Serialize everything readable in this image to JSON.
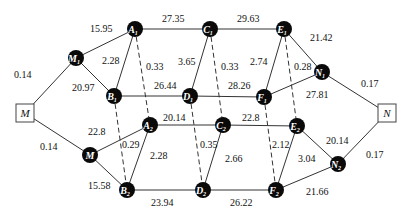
{
  "diagram": {
    "title": "",
    "terminals": [
      {
        "id": "M_src",
        "label": "M",
        "x": 25,
        "y": 113
      },
      {
        "id": "N_sink",
        "label": "N",
        "x": 387,
        "y": 113
      }
    ],
    "nodes": [
      {
        "id": "M1",
        "label": "M",
        "sub": "1",
        "x": 76,
        "y": 58
      },
      {
        "id": "A1",
        "label": "A",
        "sub": "1",
        "x": 135,
        "y": 29
      },
      {
        "id": "B1",
        "label": "B",
        "sub": "1",
        "x": 114,
        "y": 96
      },
      {
        "id": "C1",
        "label": "C",
        "sub": "1",
        "x": 210,
        "y": 29
      },
      {
        "id": "D1",
        "label": "D",
        "sub": "1",
        "x": 190,
        "y": 96
      },
      {
        "id": "E1",
        "label": "E",
        "sub": "1",
        "x": 284,
        "y": 29
      },
      {
        "id": "F1",
        "label": "F",
        "sub": "1",
        "x": 264,
        "y": 97
      },
      {
        "id": "N1",
        "label": "N",
        "sub": "1",
        "x": 322,
        "y": 72
      },
      {
        "id": "M2",
        "label": "M",
        "sub": "",
        "x": 90,
        "y": 155
      },
      {
        "id": "A2",
        "label": "A",
        "sub": "2",
        "x": 150,
        "y": 125
      },
      {
        "id": "B2",
        "label": "B",
        "sub": "2",
        "x": 127,
        "y": 190
      },
      {
        "id": "C2",
        "label": "C",
        "sub": "2",
        "x": 223,
        "y": 125
      },
      {
        "id": "D2",
        "label": "D",
        "sub": "2",
        "x": 203,
        "y": 190
      },
      {
        "id": "E2",
        "label": "E",
        "sub": "2",
        "x": 297,
        "y": 126
      },
      {
        "id": "F2",
        "label": "F",
        "sub": "2",
        "x": 276,
        "y": 190
      },
      {
        "id": "N2",
        "label": "N",
        "sub": "2",
        "x": 338,
        "y": 164
      }
    ],
    "edges": [
      {
        "from": "M_src",
        "to": "M1",
        "weight": "0.14",
        "lx": 14,
        "ly": 78,
        "dashed": false
      },
      {
        "from": "M1",
        "to": "A1",
        "weight": "15.95",
        "lx": 90,
        "ly": 32,
        "dashed": false
      },
      {
        "from": "M1",
        "to": "B1",
        "weight": "20.97",
        "lx": 72,
        "ly": 91,
        "dashed": false
      },
      {
        "from": "A1",
        "to": "B1",
        "weight": "2.28",
        "lx": 102,
        "ly": 64,
        "dashed": false
      },
      {
        "from": "A1",
        "to": "C1",
        "weight": "27.35",
        "lx": 162,
        "ly": 22,
        "dashed": false
      },
      {
        "from": "B1",
        "to": "D1",
        "weight": "26.44",
        "lx": 154,
        "ly": 89,
        "dashed": false
      },
      {
        "from": "C1",
        "to": "D1",
        "weight": "3.65",
        "lx": 178,
        "ly": 65,
        "dashed": false
      },
      {
        "from": "C1",
        "to": "E1",
        "weight": "29.63",
        "lx": 237,
        "ly": 22,
        "dashed": false
      },
      {
        "from": "D1",
        "to": "F1",
        "weight": "28.26",
        "lx": 228,
        "ly": 89,
        "dashed": false
      },
      {
        "from": "E1",
        "to": "F1",
        "weight": "2.74",
        "lx": 250,
        "ly": 65,
        "dashed": false
      },
      {
        "from": "E1",
        "to": "N1",
        "weight": "21.42",
        "lx": 310,
        "ly": 41,
        "dashed": false
      },
      {
        "from": "F1",
        "to": "N1",
        "weight": "27.81",
        "lx": 306,
        "ly": 98,
        "dashed": false
      },
      {
        "from": "N1",
        "to": "N_sink",
        "weight": "0.17",
        "lx": 361,
        "ly": 87,
        "dashed": false
      },
      {
        "from": "M_src",
        "to": "M2",
        "weight": "0.14",
        "lx": 40,
        "ly": 150,
        "dashed": false
      },
      {
        "from": "M2",
        "to": "A2",
        "weight": "22.8",
        "lx": 88,
        "ly": 135,
        "dashed": false
      },
      {
        "from": "M2",
        "to": "B2",
        "weight": "15.58",
        "lx": 88,
        "ly": 189,
        "dashed": false
      },
      {
        "from": "A2",
        "to": "B2",
        "weight": "2.28",
        "lx": 150,
        "ly": 159,
        "dashed": false
      },
      {
        "from": "A2",
        "to": "C2",
        "weight": "20.14",
        "lx": 163,
        "ly": 121,
        "dashed": false
      },
      {
        "from": "B2",
        "to": "D2",
        "weight": "23.94",
        "lx": 151,
        "ly": 206,
        "dashed": false
      },
      {
        "from": "C2",
        "to": "D2",
        "weight": "2.66",
        "lx": 225,
        "ly": 162,
        "dashed": false
      },
      {
        "from": "C2",
        "to": "E2",
        "weight": "22.8",
        "lx": 242,
        "ly": 121,
        "dashed": false
      },
      {
        "from": "D2",
        "to": "F2",
        "weight": "26.22",
        "lx": 230,
        "ly": 206,
        "dashed": false
      },
      {
        "from": "E2",
        "to": "F2",
        "weight": "3.04",
        "lx": 298,
        "ly": 162,
        "dashed": false
      },
      {
        "from": "E2",
        "to": "N2",
        "weight": "20.14",
        "lx": 326,
        "ly": 144,
        "dashed": false
      },
      {
        "from": "F2",
        "to": "N2",
        "weight": "21.66",
        "lx": 306,
        "ly": 195,
        "dashed": false
      },
      {
        "from": "N2",
        "to": "N_sink",
        "weight": "0.17",
        "lx": 366,
        "ly": 158,
        "dashed": false
      },
      {
        "from": "A1",
        "to": "A2",
        "weight": "0.33",
        "lx": 146,
        "ly": 70,
        "dashed": true
      },
      {
        "from": "B1",
        "to": "B2",
        "weight": "0.29",
        "lx": 122,
        "ly": 148,
        "dashed": true
      },
      {
        "from": "C1",
        "to": "C2",
        "weight": "0.33",
        "lx": 221,
        "ly": 70,
        "dashed": true
      },
      {
        "from": "D1",
        "to": "D2",
        "weight": "0.35",
        "lx": 200,
        "ly": 148,
        "dashed": true
      },
      {
        "from": "E1",
        "to": "E2",
        "weight": "0.28",
        "lx": 294,
        "ly": 70,
        "dashed": true
      },
      {
        "from": "F1",
        "to": "F2",
        "weight": "2.12",
        "lx": 272,
        "ly": 148,
        "dashed": true
      }
    ]
  }
}
